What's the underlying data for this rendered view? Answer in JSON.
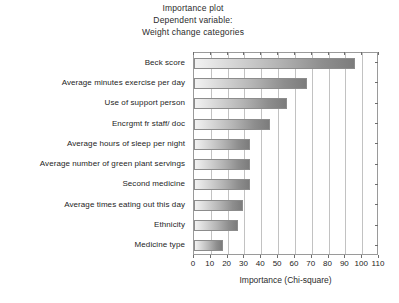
{
  "chart_data": {
    "type": "bar",
    "orientation": "horizontal",
    "title": "Importance plot\nDependent variable:\nWeight change categories",
    "title_lines": [
      "Importance plot",
      "Dependent variable:",
      "Weight change categories"
    ],
    "categories": [
      "Beck score",
      "Average minutes exercise per day",
      "Use of support person",
      "Encrgmt fr staff/ doc",
      "Average hours of sleep per night",
      "Average number of green plant servings",
      "Second medicine",
      "Average times eating out this day",
      "Ethnicity",
      "Medicine type"
    ],
    "values": [
      96,
      67,
      55,
      45,
      33,
      33,
      33,
      29,
      26,
      17
    ],
    "xlabel": "Importance (Chi-square)",
    "ylabel": "",
    "xlim": [
      0,
      110
    ],
    "xticks": [
      0,
      10,
      20,
      30,
      40,
      50,
      60,
      70,
      80,
      90,
      100,
      110
    ],
    "xticklabels": [
      "0",
      "10",
      "20",
      "30",
      "40",
      "50",
      "60",
      "70",
      "80",
      "90",
      "100",
      "110"
    ],
    "grid": "vertical",
    "legend": null,
    "bar_fill": "gray-gradient-light-to-dark",
    "frame_color": "#9a9a9a",
    "gridline_color": "#c2c2c2",
    "text_color": "#242424"
  }
}
